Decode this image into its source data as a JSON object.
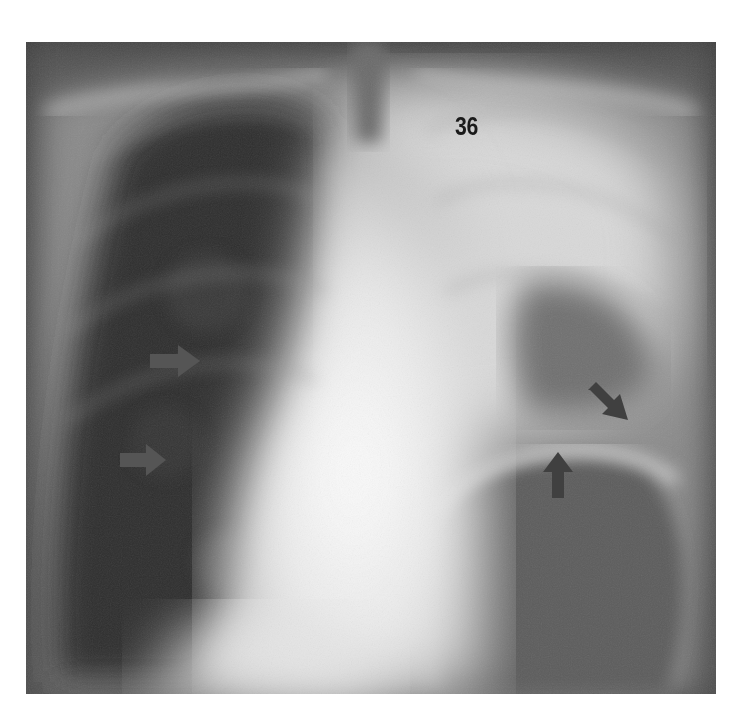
{
  "image": {
    "description": "Frontal chest X-ray radiograph",
    "figure_label": "36",
    "arrow_color": "#4a4a4a",
    "arrows": [
      {
        "id": "arrow-right-upper",
        "direction": "right"
      },
      {
        "id": "arrow-right-lower",
        "direction": "right"
      },
      {
        "id": "arrow-down-right",
        "direction": "down-right"
      },
      {
        "id": "arrow-up",
        "direction": "up"
      }
    ]
  }
}
